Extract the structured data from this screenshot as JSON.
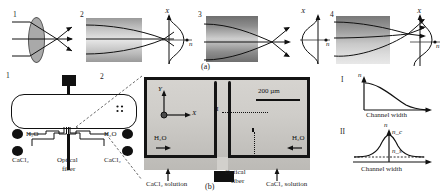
{
  "figure": {
    "caption_a": "(a)",
    "caption_b": "(b)"
  },
  "panel_a": {
    "label": "(a)",
    "steps": [
      {
        "number": "1",
        "kind": "solid-convex-lens",
        "description": "Parallel rays refracted by a solid biconvex lens converging to a focal point",
        "has_index_profile": false
      },
      {
        "number": "2",
        "kind": "converging-grin",
        "description": "Gradient index medium with high index at center focusing rays to a point",
        "has_index_profile": true,
        "profile": {
          "x_axis_label": "n",
          "y_axis_label": "X",
          "shape": "center-peak"
        }
      },
      {
        "number": "3",
        "kind": "diverging-grin",
        "description": "Gradient index medium with low index at center diverging rays after crossover",
        "has_index_profile": true,
        "profile": {
          "x_axis_label": "n",
          "y_axis_label": "X",
          "shape": "center-dip"
        }
      },
      {
        "number": "4",
        "kind": "asymmetric-grin",
        "description": "Asymmetric gradient index medium steering rays off axis",
        "has_index_profile": true,
        "profile": {
          "x_axis_label": "n",
          "y_axis_label": "X",
          "shape": "s-curve"
        }
      }
    ]
  },
  "panel_b": {
    "label": "(b)",
    "chip": {
      "number": "1",
      "inlet_labels": [
        "H₂O",
        "H₂O"
      ],
      "reagent_labels": [
        "CaCl₂",
        "CaCl₂"
      ],
      "fiber_label_line1": "Optical",
      "fiber_label_line2": "fiber"
    },
    "micrograph": {
      "number": "2",
      "scale_bar_label": "200 µm",
      "axis_y": "Y",
      "axis_x": "X",
      "section_marker": "II",
      "left_inlet": "H₂O",
      "right_inlet": "H₂O",
      "left_reagent": "CaCl₂ solution",
      "right_reagent": "CaCl₂ solution",
      "fiber_label_line1": "Optical",
      "fiber_label_line2": "fiber"
    },
    "plots": [
      {
        "number": "I",
        "y_axis_label": "n",
        "x_axis_label": "Channel width",
        "shape": "monotonic-decay",
        "description": "Refractive index decays from the wall across the channel width"
      },
      {
        "number": "II",
        "y_axis_label": "n",
        "x_axis_label": "Channel width",
        "shape": "center-peak",
        "peak_label": "n_c",
        "baseline_label": "n_s",
        "description": "Refractive index peaks at channel center n_c over baseline n_s"
      }
    ]
  },
  "colors": {
    "ink": "#111111",
    "lens_fill": "#a9a9a9",
    "micro_bg": "#c9c9c9",
    "wall": "#141414"
  }
}
